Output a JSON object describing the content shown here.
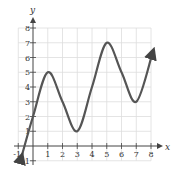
{
  "chart_data": {
    "type": "line",
    "title": "",
    "xlabel": "x",
    "ylabel": "y",
    "xlim": [
      -1,
      8
    ],
    "ylim": [
      -1,
      8
    ],
    "grid": true,
    "x_ticks": [
      "-1",
      "1",
      "2",
      "3",
      "4",
      "5",
      "6",
      "7",
      "8"
    ],
    "y_ticks": [
      "-1",
      "1",
      "2",
      "3",
      "4",
      "5",
      "6",
      "7",
      "8"
    ],
    "series": [
      {
        "name": "f(x)",
        "color": "#555555",
        "points": [
          {
            "x": -0.8,
            "y": -0.8
          },
          {
            "x": 0,
            "y": 2
          },
          {
            "x": 1,
            "y": 5
          },
          {
            "x": 2,
            "y": 3
          },
          {
            "x": 3,
            "y": 1
          },
          {
            "x": 4,
            "y": 4
          },
          {
            "x": 5,
            "y": 7
          },
          {
            "x": 6,
            "y": 5
          },
          {
            "x": 7,
            "y": 3
          },
          {
            "x": 8.1,
            "y": 6.3
          }
        ],
        "extrema": [
          {
            "type": "max",
            "x": 1,
            "y": 5
          },
          {
            "type": "min",
            "x": 3,
            "y": 1
          },
          {
            "type": "max",
            "x": 5,
            "y": 7
          },
          {
            "type": "min",
            "x": 7,
            "y": 3
          }
        ],
        "arrows_at_ends": true
      }
    ]
  }
}
